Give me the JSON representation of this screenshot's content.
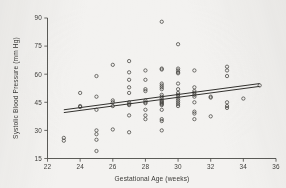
{
  "figure": {
    "background_color": "#f3f2f0",
    "ink_color": "#44433f"
  },
  "chart_data": {
    "type": "scatter",
    "title": "",
    "xlabel": "Gestational Age (weeks)",
    "ylabel": "Systolic Blood Pressure (mm Hg)",
    "xlim": [
      22,
      36
    ],
    "ylim": [
      15,
      90
    ],
    "xticks": [
      22,
      24,
      26,
      28,
      30,
      32,
      34,
      36
    ],
    "xticklabels": [
      "22",
      "24",
      "26",
      "28",
      "30",
      "32",
      "34",
      "36"
    ],
    "yticks": [
      15,
      30,
      45,
      60,
      75,
      90
    ],
    "yticklabels": [
      "15",
      "30",
      "45",
      "60",
      "75",
      "90"
    ],
    "grid": false,
    "legend": null,
    "marker": "open-circle",
    "points": [
      [
        23,
        26
      ],
      [
        23,
        24.5
      ],
      [
        24,
        50
      ],
      [
        24,
        43
      ],
      [
        24,
        42.5
      ],
      [
        25,
        59
      ],
      [
        25,
        48
      ],
      [
        25,
        41
      ],
      [
        25,
        30
      ],
      [
        25,
        28
      ],
      [
        25,
        25
      ],
      [
        25,
        19
      ],
      [
        26,
        65
      ],
      [
        26,
        46
      ],
      [
        26,
        45
      ],
      [
        26,
        43
      ],
      [
        26,
        30.5
      ],
      [
        27,
        67
      ],
      [
        27,
        61
      ],
      [
        27,
        57
      ],
      [
        27,
        53
      ],
      [
        27,
        50
      ],
      [
        27,
        45
      ],
      [
        27,
        44
      ],
      [
        27,
        43.5
      ],
      [
        27,
        38
      ],
      [
        27,
        29
      ],
      [
        28,
        62
      ],
      [
        28,
        57
      ],
      [
        28,
        52
      ],
      [
        28,
        51
      ],
      [
        28,
        46
      ],
      [
        28,
        45
      ],
      [
        28,
        44.5
      ],
      [
        28,
        41
      ],
      [
        28,
        38
      ],
      [
        28,
        36
      ],
      [
        29,
        88
      ],
      [
        29,
        63
      ],
      [
        29,
        62.5
      ],
      [
        29,
        55
      ],
      [
        29,
        54
      ],
      [
        29,
        53
      ],
      [
        29,
        52
      ],
      [
        29,
        49
      ],
      [
        29,
        48
      ],
      [
        29,
        47
      ],
      [
        29,
        46
      ],
      [
        29,
        45.5
      ],
      [
        29,
        45
      ],
      [
        29,
        44.5
      ],
      [
        29,
        44
      ],
      [
        29,
        43.5
      ],
      [
        29,
        41
      ],
      [
        29,
        36
      ],
      [
        29,
        35
      ],
      [
        29,
        30
      ],
      [
        30,
        76
      ],
      [
        30,
        63
      ],
      [
        30,
        62
      ],
      [
        30,
        61
      ],
      [
        30,
        60.5
      ],
      [
        30,
        55
      ],
      [
        30,
        52
      ],
      [
        30,
        50
      ],
      [
        30,
        49
      ],
      [
        30,
        48
      ],
      [
        30,
        47
      ],
      [
        30,
        46
      ],
      [
        30,
        45
      ],
      [
        30,
        44
      ],
      [
        30,
        43
      ],
      [
        31,
        62
      ],
      [
        31,
        53
      ],
      [
        31,
        51
      ],
      [
        31,
        50
      ],
      [
        31,
        49
      ],
      [
        31,
        48
      ],
      [
        31,
        45
      ],
      [
        31,
        40
      ],
      [
        31,
        39
      ],
      [
        31,
        36
      ],
      [
        32,
        48
      ],
      [
        32,
        47.5
      ],
      [
        32,
        37.5
      ],
      [
        33,
        64
      ],
      [
        33,
        62
      ],
      [
        33,
        59
      ],
      [
        33,
        45
      ],
      [
        33,
        43
      ],
      [
        33,
        42
      ],
      [
        34,
        47
      ],
      [
        35,
        54
      ]
    ],
    "fit_lines": [
      {
        "name": "upper-fit",
        "x_start": 23.0,
        "y_start": 41.0,
        "x_end": 35.0,
        "y_end": 55.0
      },
      {
        "name": "lower-fit",
        "x_start": 23.0,
        "y_start": 39.5,
        "x_end": 35.0,
        "y_end": 53.5
      }
    ]
  }
}
